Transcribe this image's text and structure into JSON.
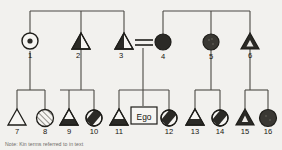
{
  "figure": {
    "type": "kinship-pedigree-diagram",
    "note": "Note: Kin terms referred to in text",
    "ego_label": "Ego",
    "colors": {
      "fill_dark": "#2b2a26",
      "line": "#4b4944",
      "background": "#f2f1ee",
      "symbol_stroke": "#1e1d19",
      "open": "#f6f5f2",
      "hatch": "#8f8d87"
    }
  },
  "generations": [
    {
      "name": "generation-1",
      "individuals": [
        {
          "id": "1",
          "label": "1",
          "sex": "female",
          "shape": "circle",
          "pattern": "dot-center",
          "x": 30,
          "y": 42
        },
        {
          "id": "2",
          "label": "2",
          "sex": "male",
          "shape": "triangle",
          "pattern": "left-half-filled",
          "x": 81,
          "y": 42
        },
        {
          "id": "3",
          "label": "3",
          "sex": "male",
          "shape": "triangle",
          "pattern": "left-half-filled",
          "x": 124,
          "y": 42
        },
        {
          "id": "4",
          "label": "4",
          "sex": "female",
          "shape": "circle",
          "pattern": "filled",
          "x": 163,
          "y": 42
        },
        {
          "id": "5",
          "label": "5",
          "sex": "female",
          "shape": "circle",
          "pattern": "filled-stippled",
          "x": 211,
          "y": 42
        },
        {
          "id": "6",
          "label": "6",
          "sex": "male",
          "shape": "triangle",
          "pattern": "filled-with-inner-triangle",
          "x": 250,
          "y": 42
        }
      ]
    },
    {
      "name": "generation-2",
      "individuals": [
        {
          "id": "7",
          "label": "7",
          "sex": "male",
          "shape": "triangle",
          "pattern": "open",
          "x": 17,
          "y": 116
        },
        {
          "id": "8",
          "label": "8",
          "sex": "female",
          "shape": "circle",
          "pattern": "hatched",
          "x": 45,
          "y": 116
        },
        {
          "id": "9",
          "label": "9",
          "sex": "male",
          "shape": "triangle",
          "pattern": "bottom-filled",
          "x": 69,
          "y": 116
        },
        {
          "id": "10",
          "label": "10",
          "sex": "female",
          "shape": "circle",
          "pattern": "diagonal-band",
          "x": 94,
          "y": 116
        },
        {
          "id": "11",
          "label": "11",
          "sex": "male",
          "shape": "triangle",
          "pattern": "bottom-filled",
          "x": 119,
          "y": 116
        },
        {
          "id": "ego",
          "label": "Ego",
          "sex": "ego",
          "shape": "square",
          "pattern": "open",
          "x": 145,
          "y": 116
        },
        {
          "id": "12",
          "label": "12",
          "sex": "female",
          "shape": "circle",
          "pattern": "diagonal-band",
          "x": 169,
          "y": 116
        },
        {
          "id": "13",
          "label": "13",
          "sex": "male",
          "shape": "triangle",
          "pattern": "bottom-filled",
          "x": 195,
          "y": 116
        },
        {
          "id": "14",
          "label": "14",
          "sex": "female",
          "shape": "circle",
          "pattern": "diagonal-band",
          "x": 220,
          "y": 116
        },
        {
          "id": "15",
          "label": "15",
          "sex": "male",
          "shape": "triangle",
          "pattern": "filled-with-inner-triangle",
          "x": 245,
          "y": 116
        },
        {
          "id": "16",
          "label": "16",
          "sex": "female",
          "shape": "circle",
          "pattern": "filled",
          "x": 268,
          "y": 116
        }
      ]
    }
  ],
  "marriages": [
    {
      "name": "marriage-3-4",
      "between": [
        "3",
        "4"
      ],
      "style": "double-line",
      "x1": 134,
      "x2": 153,
      "y": 42
    }
  ],
  "sibships": [
    {
      "name": "sibship-top-left",
      "members": [
        "1",
        "2",
        "3"
      ],
      "bar_y": 11,
      "x1": 30,
      "x2": 124
    },
    {
      "name": "sibship-top-right",
      "members": [
        "4",
        "5",
        "6"
      ],
      "bar_y": 11,
      "x1": 163,
      "x2": 250
    },
    {
      "name": "sibship-7-8",
      "parent": "1",
      "members": [
        "7",
        "8"
      ],
      "bar_y": 90,
      "x1": 17,
      "x2": 45
    },
    {
      "name": "sibship-9-10",
      "parent": "2",
      "members": [
        "9",
        "10"
      ],
      "bar_y": 90,
      "x1": 69,
      "x2": 94
    },
    {
      "name": "sibship-11-ego-12",
      "parent": "marriage-3-4",
      "members": [
        "11",
        "ego",
        "12"
      ],
      "bar_y": 90,
      "x1": 119,
      "x2": 169
    },
    {
      "name": "sibship-13-14",
      "parent": "5",
      "members": [
        "13",
        "14"
      ],
      "bar_y": 90,
      "x1": 195,
      "x2": 220
    },
    {
      "name": "sibship-15-16",
      "parent": "6",
      "members": [
        "15",
        "16"
      ],
      "bar_y": 90,
      "x1": 245,
      "x2": 268
    }
  ]
}
